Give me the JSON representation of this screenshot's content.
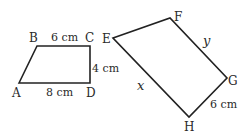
{
  "shape1": {
    "vertices": {
      "A": {
        "label": "A",
        "x": 19,
        "y": 83
      },
      "B": {
        "label": "B",
        "x": 37,
        "y": 46
      },
      "C": {
        "label": "C",
        "x": 90,
        "y": 46
      },
      "D": {
        "label": "D",
        "x": 90,
        "y": 83
      }
    },
    "sides": {
      "BC": "6 cm",
      "CD": "4 cm",
      "AD": "8 cm"
    }
  },
  "shape2": {
    "vertices": {
      "E": {
        "label": "E",
        "x": 113,
        "y": 38
      },
      "F": {
        "label": "F",
        "x": 170,
        "y": 18
      },
      "G": {
        "label": "G",
        "x": 227,
        "y": 78
      },
      "H": {
        "label": "H",
        "x": 189,
        "y": 117
      }
    },
    "sides": {
      "FG": "y",
      "EH": "x",
      "GH": "6 cm"
    }
  },
  "style": {
    "stroke": "#222222"
  }
}
